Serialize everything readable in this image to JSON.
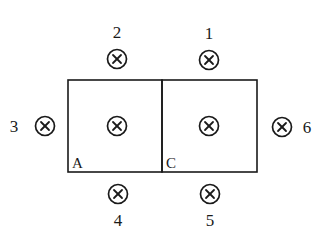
{
  "diagram": {
    "stroke_color": "#1a1a1a",
    "background": "#ffffff",
    "regions": [
      {
        "id": "A",
        "label": "A",
        "x": 68,
        "y": 80,
        "width": 94,
        "height": 92
      },
      {
        "id": "C",
        "label": "C",
        "x": 162,
        "y": 80,
        "width": 95,
        "height": 92
      }
    ],
    "wires": [
      {
        "id": "1",
        "label": "1",
        "cx": 209,
        "cy": 60,
        "label_x": 209,
        "label_y": 39,
        "direction": "into-page"
      },
      {
        "id": "2",
        "label": "2",
        "cx": 117,
        "cy": 59,
        "label_x": 117,
        "label_y": 38,
        "direction": "into-page"
      },
      {
        "id": "3",
        "label": "3",
        "cx": 45,
        "cy": 126,
        "label_x": 14,
        "label_y": 132,
        "direction": "into-page"
      },
      {
        "id": "4",
        "label": "4",
        "cx": 118,
        "cy": 194,
        "label_x": 118,
        "label_y": 226,
        "direction": "into-page"
      },
      {
        "id": "5",
        "label": "5",
        "cx": 210,
        "cy": 194,
        "label_x": 210,
        "label_y": 226,
        "direction": "into-page"
      },
      {
        "id": "6",
        "label": "6",
        "cx": 282,
        "cy": 127,
        "label_x": 308,
        "label_y": 133,
        "direction": "into-page"
      },
      {
        "id": "center-A",
        "label": "",
        "cx": 117,
        "cy": 126,
        "direction": "into-page"
      },
      {
        "id": "center-C",
        "label": "",
        "cx": 209,
        "cy": 126,
        "direction": "into-page"
      }
    ],
    "symbol_radius": 10,
    "labels": {
      "wire1": "1",
      "wire2": "2",
      "wire3": "3",
      "wire4": "4",
      "wire5": "5",
      "wire6": "6",
      "regionA": "A",
      "regionC": "C"
    }
  }
}
